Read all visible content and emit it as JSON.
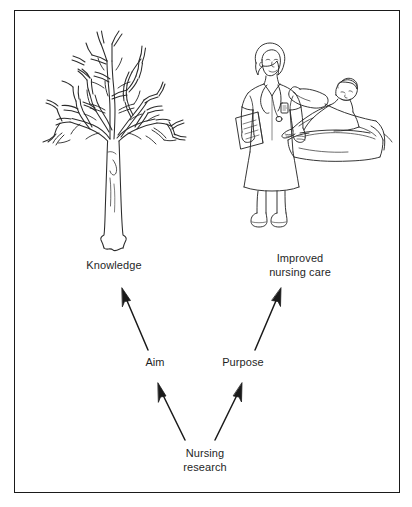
{
  "figure": {
    "background_color": "#ffffff",
    "border_color": "#1a1a1a",
    "ink_color": "#1f1f1f"
  },
  "nodes": {
    "knowledge": "Knowledge",
    "improved_nursing_care": "Improved\nnursing care",
    "aim": "Aim",
    "purpose": "Purpose",
    "nursing_research": "Nursing\nresearch"
  },
  "illustrations": [
    {
      "name": "bare-tree-illustration",
      "caption": "Knowledge"
    },
    {
      "name": "nurse-and-patient-illustration",
      "caption": "Improved nursing care"
    }
  ],
  "arrows": [
    {
      "name": "arrow-aim-to-knowledge",
      "from": "Aim",
      "to": "Knowledge"
    },
    {
      "name": "arrow-purpose-to-improved-nursing-care",
      "from": "Purpose",
      "to": "Improved nursing care"
    },
    {
      "name": "arrow-nursing-research-to-aim",
      "from": "Nursing research",
      "to": "Aim"
    },
    {
      "name": "arrow-nursing-research-to-purpose",
      "from": "Nursing research",
      "to": "Purpose"
    }
  ]
}
